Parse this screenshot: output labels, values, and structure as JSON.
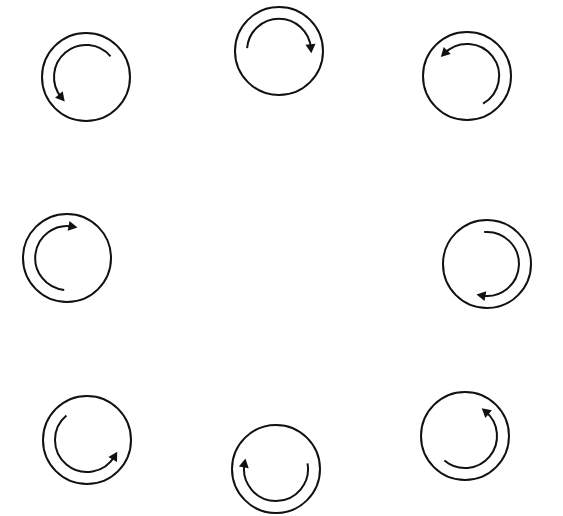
{
  "diagram": {
    "title": "",
    "stroke_color": "#111111",
    "background_color": "#ffffff",
    "outer_radius": 44,
    "arc_radius": 32,
    "items": [
      {
        "id": "top-left",
        "cx": 86,
        "cy": 77,
        "r": 44,
        "direction": "counterclockwise",
        "arc_start_deg": -40,
        "arc_end_deg": 140
      },
      {
        "id": "top-center",
        "cx": 279,
        "cy": 51,
        "r": 44,
        "direction": "clockwise",
        "arc_start_deg": 185,
        "arc_end_deg": 355
      },
      {
        "id": "top-right",
        "cx": 467,
        "cy": 76,
        "r": 44,
        "direction": "counterclockwise",
        "arc_start_deg": 60,
        "arc_end_deg": 225
      },
      {
        "id": "middle-left",
        "cx": 67,
        "cy": 258,
        "r": 44,
        "direction": "clockwise",
        "arc_start_deg": 95,
        "arc_end_deg": 280
      },
      {
        "id": "middle-right",
        "cx": 487,
        "cy": 264,
        "r": 44,
        "direction": "clockwise",
        "arc_start_deg": -95,
        "arc_end_deg": 100
      },
      {
        "id": "bottom-left",
        "cx": 87,
        "cy": 440,
        "r": 44,
        "direction": "counterclockwise",
        "arc_start_deg": 230,
        "arc_end_deg": 30
      },
      {
        "id": "bottom-center",
        "cx": 276,
        "cy": 469,
        "r": 44,
        "direction": "clockwise",
        "arc_start_deg": -10,
        "arc_end_deg": 190
      },
      {
        "id": "bottom-right",
        "cx": 465,
        "cy": 436,
        "r": 44,
        "direction": "counterclockwise",
        "arc_start_deg": 130,
        "arc_end_deg": -50
      }
    ]
  }
}
